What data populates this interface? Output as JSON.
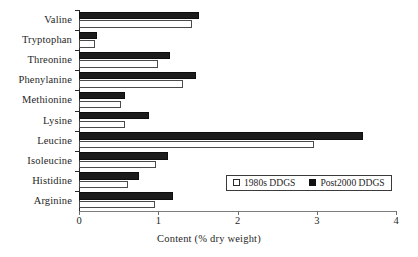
{
  "chart_data": {
    "type": "bar",
    "orientation": "horizontal",
    "title": "",
    "xlabel": "Content (% dry weight)",
    "ylabel": "",
    "xlim": [
      0,
      4
    ],
    "xticks": [
      "0",
      "1",
      "2",
      "3",
      "4"
    ],
    "grid": false,
    "legend_position": "inside-right",
    "categories": [
      "Valine",
      "Tryptophan",
      "Threonine",
      "Phenylanine",
      "Methionine",
      "Lysine",
      "Leucine",
      "Isoleucine",
      "Histidine",
      "Arginine"
    ],
    "series": [
      {
        "name": "1980s DDGS",
        "style": "open",
        "color": "#ffffff",
        "edge_color": "#4a4a4a",
        "values": [
          1.43,
          0.2,
          1.0,
          1.31,
          0.53,
          0.58,
          2.97,
          0.97,
          0.62,
          0.96
        ]
      },
      {
        "name": "Post2000 DDGS",
        "style": "filled",
        "color": "#1c1c1c",
        "edge_color": "#0d0d0d",
        "values": [
          1.52,
          0.23,
          1.15,
          1.48,
          0.58,
          0.88,
          3.58,
          1.12,
          0.76,
          1.18
        ]
      }
    ]
  },
  "legend": {
    "entries": [
      {
        "label": "1980s DDGS"
      },
      {
        "label": "Post2000 DDGS"
      }
    ]
  }
}
